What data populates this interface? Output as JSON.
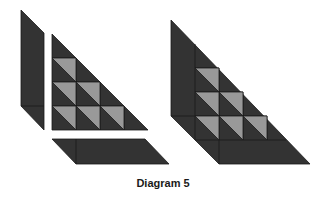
{
  "caption": "Diagram 5",
  "colors": {
    "dark": "#333333",
    "light": "#999999",
    "stroke": "#1a1a1a",
    "background": "#ffffff"
  },
  "grid": {
    "cell_size": 24
  },
  "left_figure": {
    "description": "Disassembled: vertical parallelogram strip, staircase triangle with gray half-cells, horizontal parallelogram strip",
    "pieces": [
      "left-strip",
      "center-triangle",
      "bottom-strip"
    ],
    "gray_cells_per_row": [
      1,
      2,
      3
    ]
  },
  "right_figure": {
    "description": "Assembled large right triangle combining the three pieces",
    "gray_cells_per_row": [
      1,
      2,
      3
    ]
  }
}
